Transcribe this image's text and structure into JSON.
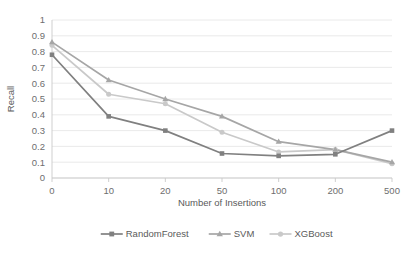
{
  "chart_data": {
    "type": "line",
    "title": "",
    "xlabel": "Number of Insertions",
    "ylabel": "Recall",
    "categories": [
      "0",
      "10",
      "20",
      "50",
      "100",
      "200",
      "500"
    ],
    "ylim": [
      0,
      1
    ],
    "yticks": [
      "0",
      "0.1",
      "0.2",
      "0.3",
      "0.4",
      "0.5",
      "0.6",
      "0.7",
      "0.8",
      "0.9",
      "1"
    ],
    "grid": "horizontal",
    "legend_position": "bottom",
    "series": [
      {
        "name": "RandomForest",
        "color": "#808080",
        "marker": "square",
        "values": [
          0.78,
          0.39,
          0.3,
          0.155,
          0.14,
          0.15,
          0.3
        ]
      },
      {
        "name": "SVM",
        "color": "#a6a6a6",
        "marker": "triangle",
        "values": [
          0.86,
          0.62,
          0.5,
          0.39,
          0.23,
          0.18,
          0.1
        ]
      },
      {
        "name": "XGBoost",
        "color": "#c9c9c9",
        "marker": "circle",
        "values": [
          0.84,
          0.53,
          0.47,
          0.29,
          0.165,
          0.18,
          0.09
        ]
      }
    ]
  },
  "legend": {
    "items": [
      {
        "label": "RandomForest"
      },
      {
        "label": "SVM"
      },
      {
        "label": "XGBoost"
      }
    ]
  },
  "axes": {
    "y_title": "Recall",
    "x_title": "Number of Insertions"
  }
}
